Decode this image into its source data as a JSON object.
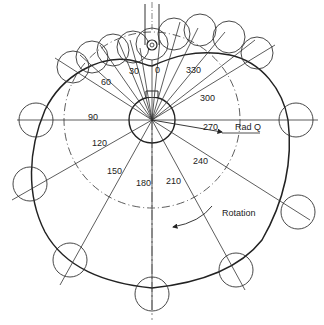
{
  "diagram": {
    "angle_labels": [
      "0",
      "30",
      "60",
      "90",
      "120",
      "150",
      "180",
      "210",
      "240",
      "270",
      "300",
      "330"
    ],
    "annotations": {
      "radius_label": "Rad Q",
      "rotation_label": "Rotation"
    },
    "caption_partial": "(caption text cut off at bottom edge)",
    "colors": {
      "line": "#222222",
      "background": "#ffffff"
    }
  }
}
